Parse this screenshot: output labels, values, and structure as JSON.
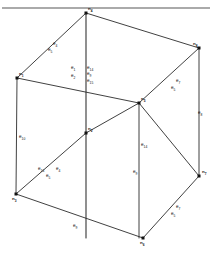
{
  "figure": {
    "kind": "cube-wireframe-diagram",
    "title_ghost": "",
    "footer_ghost": "",
    "line_color": "#2b2b2b",
    "vertex_color": "#111111",
    "background": "#ffffff"
  },
  "nodes": [
    {
      "id": "n-top",
      "label": "n",
      "sub": "4",
      "x": 86,
      "y": 13,
      "lx": 88,
      "ly": 7
    },
    {
      "id": "n-left-upper",
      "label": "n",
      "sub": "1",
      "x": 17,
      "y": 78,
      "lx": 19,
      "ly": 72
    },
    {
      "id": "n-right-upper",
      "label": "n",
      "sub": "8",
      "x": 199,
      "y": 48,
      "lx": 193,
      "ly": 42
    },
    {
      "id": "n-back-mid",
      "label": "n",
      "sub": "5",
      "x": 139,
      "y": 103,
      "lx": 141,
      "ly": 97
    },
    {
      "id": "n-center",
      "label": "n",
      "sub": "2",
      "x": 86,
      "y": 133,
      "lx": 88,
      "ly": 127
    },
    {
      "id": "n-left-lower",
      "label": "n",
      "sub": "3",
      "x": 16,
      "y": 194,
      "lx": 12,
      "ly": 197
    },
    {
      "id": "n-right-lower",
      "label": "n",
      "sub": "7",
      "x": 199,
      "y": 176,
      "lx": 202,
      "ly": 170
    },
    {
      "id": "n-bottom",
      "label": "n",
      "sub": "6",
      "x": 143,
      "y": 238,
      "lx": 140,
      "ly": 241
    }
  ],
  "edges": [
    {
      "id": "e-top-left",
      "label": "e",
      "sub": "4",
      "lx": 53,
      "ly": 42
    },
    {
      "id": "e-top-right",
      "label": "e",
      "sub": "7",
      "lx": 176,
      "ly": 79
    },
    {
      "id": "e-vert-right",
      "label": "e",
      "sub": "8",
      "lx": 198,
      "ly": 111
    },
    {
      "id": "e-vert-left",
      "label": "e",
      "sub": "10",
      "lx": 19,
      "ly": 135
    },
    {
      "id": "e-bottom-left",
      "label": "e",
      "sub": "4",
      "lx": 56,
      "ly": 167
    },
    {
      "id": "e-bottom-right",
      "label": "e",
      "sub": "7",
      "lx": 176,
      "ly": 205
    },
    {
      "id": "e-bottom-front",
      "label": "e",
      "sub": "9",
      "lx": 73,
      "ly": 224
    },
    {
      "id": "e-vert-center",
      "label": "e",
      "sub": "9",
      "lx": 133,
      "ly": 170
    },
    {
      "id": "e-center-upper",
      "label": "e",
      "sub": "14",
      "lx": 87,
      "ly": 66
    },
    {
      "id": "e-center-mid",
      "label": "e",
      "sub": "9",
      "lx": 87,
      "ly": 72
    },
    {
      "id": "e-center-lower",
      "label": "e",
      "sub": "15",
      "lx": 87,
      "ly": 79
    },
    {
      "id": "e-right-mid",
      "label": "e",
      "sub": "14",
      "lx": 141,
      "ly": 143
    },
    {
      "id": "e-left-cluster-a",
      "label": "e",
      "sub": "16",
      "lx": 38,
      "ly": 167
    },
    {
      "id": "e-stack-a",
      "label": "e",
      "sub": "1",
      "lx": 71,
      "ly": 66
    },
    {
      "id": "e-stack-b",
      "label": "e",
      "sub": "2",
      "lx": 71,
      "ly": 74
    },
    {
      "id": "e-short-left",
      "label": "e",
      "sub": "5",
      "lx": 48,
      "ly": 48
    },
    {
      "id": "e-short-right",
      "label": "e",
      "sub": "5",
      "lx": 171,
      "ly": 86
    },
    {
      "id": "e-short-low-left",
      "label": "e",
      "sub": "5",
      "lx": 46,
      "ly": 174
    },
    {
      "id": "e-short-low-right",
      "label": "e",
      "sub": "5",
      "lx": 171,
      "ly": 212
    }
  ],
  "geometry": {
    "faces_note": "cube drawn in oblique projection; near-bottom face and far-top face visible",
    "polylines": [
      {
        "id": "outer-silhouette",
        "points": "17,78 86,13 199,48 199,176 143,238 16,194 17,78"
      },
      {
        "id": "top-face",
        "points": "17,78 86,13 199,48 139,103 17,78"
      },
      {
        "id": "front-vert",
        "points": "86,133 86,238"
      },
      {
        "id": "center-vert",
        "points": "86,13 86,133"
      },
      {
        "id": "mid-face",
        "points": "16,194 86,133 139,103"
      },
      {
        "id": "right-edge",
        "points": "139,103 199,48"
      },
      {
        "id": "right-vert",
        "points": "139,103 139,238"
      },
      {
        "id": "bottom-face",
        "points": "16,194 143,238 199,176 139,103"
      },
      {
        "id": "left-vert",
        "points": "17,78 16,194"
      }
    ]
  }
}
